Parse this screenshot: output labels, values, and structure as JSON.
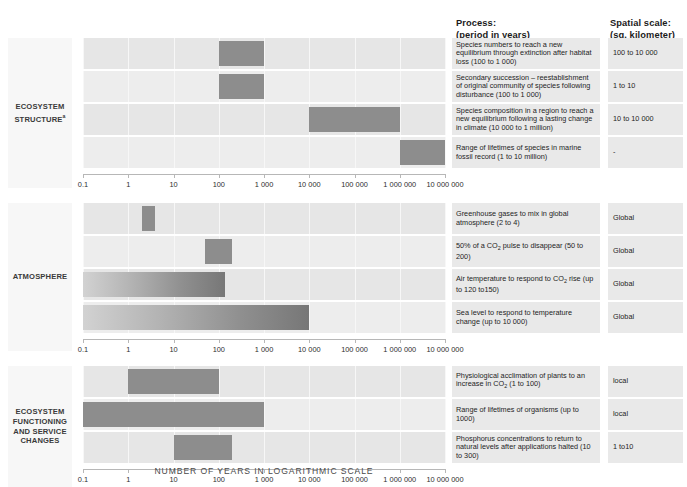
{
  "headers": {
    "process_line1": "Process:",
    "process_line2": "(period in years)",
    "spatial_line1": "Spatial scale:",
    "spatial_line2": "(sq. kilometer)"
  },
  "axis_title": "NUMBER OF YEARS IN LOGARITHMIC SCALE",
  "axis_ticks": [
    "0.1",
    "1",
    "10",
    "100",
    "1 000",
    "10 000",
    "100 000",
    "1 000 000",
    "10 000 000"
  ],
  "sections": [
    {
      "label": "ECOSYSTEM STRUCTURE",
      "label_superscript": "a",
      "rows": [
        {
          "process": "Species numbers to reach a new equilibrium through extinction after habitat loss (100 to 1 000)",
          "spatial": "100 to 10 000",
          "start": 100,
          "end": 1000,
          "gradient": false
        },
        {
          "process": "Secondary succession – reestablishment of original community of species following disturbance (100 to 1 000)",
          "spatial": "1 to 10",
          "start": 100,
          "end": 1000,
          "gradient": false
        },
        {
          "process": "Species composition in a region to reach a new equilibrium following a lasting change in climate (10 000 to 1 million)",
          "spatial": "10 to 10 000",
          "start": 10000,
          "end": 1000000,
          "gradient": false
        },
        {
          "process": "Range of lifetimes of species in marine fossil record (1 to 10 million)",
          "spatial": "-",
          "start": 1000000,
          "end": 10000000,
          "gradient": false
        }
      ]
    },
    {
      "label": "ATMOSPHERE",
      "label_superscript": "",
      "rows": [
        {
          "process": "Greenhouse gases to mix in global atmosphere (2 to 4)",
          "spatial": "Global",
          "start": 2,
          "end": 4,
          "gradient": false
        },
        {
          "process": "50% of a CO2 pulse to disappear (50 to 200)",
          "spatial": "Global",
          "start": 50,
          "end": 200,
          "gradient": false
        },
        {
          "process": "Air temperature to respond to CO2 rise (up to 120 to150)",
          "spatial": "Global",
          "start": 0.1,
          "end": 135,
          "gradient": true
        },
        {
          "process": "Sea level to respond to temperature change (up to 10 000)",
          "spatial": "Global",
          "start": 0.1,
          "end": 10000,
          "gradient": true
        }
      ]
    },
    {
      "label": "ECOSYSTEM FUNCTIONING AND SERVICE CHANGES",
      "label_superscript": "",
      "rows": [
        {
          "process": "Physiological acclimation of plants to an increase in CO2 (1 to 100)",
          "spatial": "local",
          "start": 1,
          "end": 100,
          "gradient": false
        },
        {
          "process": "Range of lifetimes of organisms (up to 1000)",
          "spatial": "local",
          "start": 0.1,
          "end": 1000,
          "gradient": false
        },
        {
          "process": "Phosphorus concentrations to return to natural levels after applications halted  (10 to 300)",
          "spatial": "1 to10",
          "start": 10,
          "end": 200,
          "gradient": false
        }
      ]
    }
  ],
  "chart_data": {
    "type": "bar",
    "title": "",
    "xlabel": "NUMBER OF YEARS IN LOGARITHMIC SCALE",
    "ylabel": "",
    "xscale": "log",
    "xlim": [
      0.1,
      10000000
    ],
    "xticks": [
      0.1,
      1,
      10,
      100,
      1000,
      10000,
      100000,
      1000000,
      10000000
    ],
    "xticklabels": [
      "0.1",
      "1",
      "10",
      "100",
      "1 000",
      "10 000",
      "100 000",
      "1 000 000",
      "10 000 000"
    ],
    "grid": true,
    "legend": "none",
    "orientation": "horizontal",
    "groups": [
      {
        "name": "ECOSYSTEM STRUCTURE",
        "bars": [
          {
            "label": "Species numbers to reach a new equilibrium through extinction after habitat loss",
            "range": [
              100,
              1000
            ],
            "spatial_scale": "100 to 10 000"
          },
          {
            "label": "Secondary succession – reestablishment of original community of species following disturbance",
            "range": [
              100,
              1000
            ],
            "spatial_scale": "1 to 10"
          },
          {
            "label": "Species composition in a region to reach a new equilibrium following a lasting change in climate",
            "range": [
              10000,
              1000000
            ],
            "spatial_scale": "10 to 10 000"
          },
          {
            "label": "Range of lifetimes of species in marine fossil record",
            "range": [
              1000000,
              10000000
            ],
            "spatial_scale": "-"
          }
        ]
      },
      {
        "name": "ATMOSPHERE",
        "bars": [
          {
            "label": "Greenhouse gases to mix in global atmosphere",
            "range": [
              2,
              4
            ],
            "spatial_scale": "Global"
          },
          {
            "label": "50% of a CO2 pulse to disappear",
            "range": [
              50,
              200
            ],
            "spatial_scale": "Global"
          },
          {
            "label": "Air temperature to respond to CO2 rise",
            "range": [
              0.1,
              135
            ],
            "spatial_scale": "Global"
          },
          {
            "label": "Sea level to respond to temperature change",
            "range": [
              0.1,
              10000
            ],
            "spatial_scale": "Global"
          }
        ]
      },
      {
        "name": "ECOSYSTEM FUNCTIONING AND SERVICE CHANGES",
        "bars": [
          {
            "label": "Physiological acclimation of plants to an increase in CO2",
            "range": [
              1,
              100
            ],
            "spatial_scale": "local"
          },
          {
            "label": "Range of lifetimes of organisms",
            "range": [
              0.1,
              1000
            ],
            "spatial_scale": "local"
          },
          {
            "label": "Phosphorus concentrations to return to natural levels after applications halted",
            "range": [
              10,
              200
            ],
            "spatial_scale": "1 to10"
          }
        ]
      }
    ]
  }
}
